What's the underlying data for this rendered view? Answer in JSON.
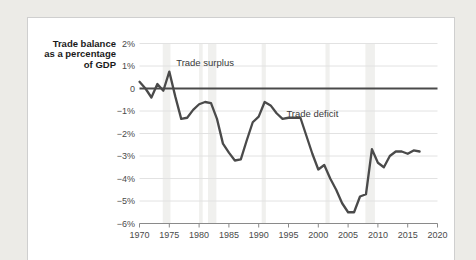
{
  "chart_data": {
    "type": "line",
    "title": "",
    "ylabel_lines": [
      "Trade balance",
      "as a percentage",
      "of GDP"
    ],
    "xlabel": "",
    "xlim": [
      1970,
      2020
    ],
    "ylim": [
      -6,
      2
    ],
    "grid": true,
    "legend": "none",
    "y_ticks": [
      "2%",
      "1%",
      "0",
      "−1%",
      "−2%",
      "−3%",
      "−4%",
      "−5%",
      "−6%"
    ],
    "y_tick_values": [
      2,
      1,
      0,
      -1,
      -2,
      -3,
      -4,
      -5,
      -6
    ],
    "x_ticks": [
      "1970",
      "1975",
      "1980",
      "1985",
      "1990",
      "1995",
      "2000",
      "2005",
      "2010",
      "2015",
      "2020"
    ],
    "x_tick_values": [
      1970,
      1975,
      1980,
      1985,
      1990,
      1995,
      2000,
      2005,
      2010,
      2015,
      2020
    ],
    "annotations": [
      {
        "text": "Trade surplus",
        "x": 1981,
        "y": 1.0
      },
      {
        "text": "Trade deficit",
        "x": 1999,
        "y": -1.25
      }
    ],
    "zero_reference_line": 0,
    "recession_bands": [
      {
        "start": 1973.9,
        "end": 1975.2
      },
      {
        "start": 1980.0,
        "end": 1980.6
      },
      {
        "start": 1981.5,
        "end": 1982.9
      },
      {
        "start": 1990.5,
        "end": 1991.2
      },
      {
        "start": 2001.2,
        "end": 2001.9
      },
      {
        "start": 2007.9,
        "end": 2009.5
      }
    ],
    "series": [
      {
        "name": "Trade balance as a percentage of GDP",
        "color": "#4a4a4a",
        "x": [
          1970,
          1971,
          1972,
          1973,
          1974,
          1975,
          1976,
          1977,
          1978,
          1979,
          1980,
          1981,
          1982,
          1983,
          1984,
          1985,
          1986,
          1987,
          1988,
          1989,
          1990,
          1991,
          1992,
          1993,
          1994,
          1995,
          1996,
          1997,
          1998,
          1999,
          2000,
          2001,
          2002,
          2003,
          2004,
          2005,
          2006,
          2007,
          2008,
          2009,
          2010,
          2011,
          2012,
          2013,
          2014,
          2015,
          2016,
          2017
        ],
        "values": [
          0.3,
          0.0,
          -0.4,
          0.2,
          -0.1,
          0.75,
          -0.35,
          -1.35,
          -1.3,
          -0.95,
          -0.7,
          -0.6,
          -0.65,
          -1.35,
          -2.45,
          -2.85,
          -3.2,
          -3.15,
          -2.3,
          -1.5,
          -1.25,
          -0.6,
          -0.75,
          -1.1,
          -1.35,
          -1.3,
          -1.3,
          -1.3,
          -2.1,
          -2.9,
          -3.6,
          -3.4,
          -4.0,
          -4.5,
          -5.1,
          -5.5,
          -5.5,
          -4.8,
          -4.7,
          -2.7,
          -3.3,
          -3.5,
          -3.0,
          -2.8,
          -2.8,
          -2.9,
          -2.75,
          -2.8
        ]
      }
    ]
  },
  "card": {
    "background_color": "#ffffff",
    "border_color": "#cfcfcf"
  },
  "page": {
    "background_color": "#ecebe7"
  }
}
